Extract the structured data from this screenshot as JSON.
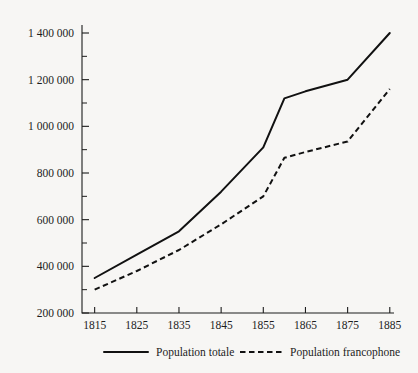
{
  "chart_data": {
    "type": "line",
    "title": "",
    "subtitle": "",
    "xlabel": "",
    "ylabel": "",
    "x": [
      1815,
      1825,
      1835,
      1845,
      1855,
      1860,
      1865,
      1875,
      1885
    ],
    "xlim": [
      1812,
      1886
    ],
    "ylim": [
      200000,
      1400000
    ],
    "grid": false,
    "legend_position": "bottom",
    "y_ticks_major": [
      200000,
      400000,
      600000,
      800000,
      1000000,
      1200000,
      1400000
    ],
    "y_ticks_major_labels": [
      "200 000",
      "400 000",
      "600 000",
      "800 000",
      "1 000 000",
      "1 200 000",
      "1 400 000"
    ],
    "y_ticks_minor": [
      300000,
      500000,
      700000,
      900000,
      1100000,
      1300000
    ],
    "x_ticks": [
      1815,
      1825,
      1835,
      1845,
      1855,
      1865,
      1875,
      1885
    ],
    "x_tick_labels": [
      "1815",
      "1825",
      "1835",
      "1845",
      "1855",
      "1865",
      "1875",
      "1885"
    ],
    "series": [
      {
        "name": "Population totale",
        "style": "solid",
        "color": "#111111",
        "values": [
          350000,
          450000,
          550000,
          720000,
          910000,
          1120000,
          1150000,
          1200000,
          1400000
        ]
      },
      {
        "name": "Population francophone",
        "style": "dashed",
        "color": "#111111",
        "values": [
          300000,
          380000,
          470000,
          580000,
          700000,
          865000,
          890000,
          935000,
          1160000
        ]
      }
    ]
  },
  "legend": {
    "items": [
      {
        "label": "Population totale",
        "style": "solid"
      },
      {
        "label": "Population francophone",
        "style": "dashed"
      }
    ]
  }
}
